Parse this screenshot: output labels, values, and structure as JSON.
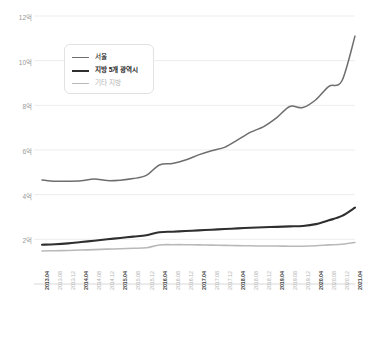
{
  "chart_data": {
    "type": "line",
    "title": "",
    "subtitle": "",
    "xlabel": "",
    "ylabel": "",
    "ylim": [
      0,
      12
    ],
    "yticks": [
      2,
      4,
      6,
      8,
      10,
      12
    ],
    "ytick_labels": [
      "2억",
      "4억",
      "6억",
      "8억",
      "10억",
      "12억"
    ],
    "grid": true,
    "legend_position": "upper-left-inside",
    "unit_note": "억",
    "x": [
      "2013.04",
      "2013.08",
      "2013.12",
      "2014.04",
      "2014.08",
      "2014.12",
      "2015.04",
      "2015.08",
      "2015.12",
      "2016.04",
      "2016.08",
      "2016.12",
      "2017.04",
      "2017.08",
      "2017.12",
      "2018.04",
      "2018.08",
      "2018.12",
      "2019.04",
      "2019.08",
      "2019.12",
      "2020.04",
      "2020.08",
      "2020.12",
      "2021.04"
    ],
    "xtick_major": [
      "2013.04",
      "2014.04",
      "2015.04",
      "2016.04",
      "2017.04",
      "2018.04",
      "2019.04",
      "2020.04",
      "2021.04"
    ],
    "series": [
      {
        "name": "서울",
        "color": "#6e6e6e",
        "width": 1.5,
        "values": [
          4.66,
          4.6,
          4.6,
          4.62,
          4.7,
          4.63,
          4.65,
          4.72,
          4.86,
          5.33,
          5.4,
          5.55,
          5.78,
          5.97,
          6.12,
          6.45,
          6.8,
          7.05,
          7.45,
          7.95,
          7.9,
          8.25,
          8.85,
          9.1,
          11.1
        ]
      },
      {
        "name": "지방 5개 광역시",
        "color": "#2f2f2f",
        "width": 2.1,
        "values": [
          1.76,
          1.78,
          1.82,
          1.88,
          1.94,
          2.0,
          2.06,
          2.12,
          2.18,
          2.32,
          2.34,
          2.37,
          2.4,
          2.43,
          2.46,
          2.49,
          2.52,
          2.54,
          2.56,
          2.58,
          2.6,
          2.68,
          2.85,
          3.05,
          3.42
        ]
      },
      {
        "name": "기타 지방",
        "color": "#b9b9b9",
        "width": 1.6,
        "values": [
          1.48,
          1.49,
          1.5,
          1.52,
          1.54,
          1.56,
          1.58,
          1.6,
          1.62,
          1.75,
          1.76,
          1.76,
          1.75,
          1.74,
          1.73,
          1.72,
          1.71,
          1.7,
          1.7,
          1.69,
          1.69,
          1.71,
          1.75,
          1.78,
          1.86
        ]
      }
    ]
  },
  "legend": {
    "items": [
      {
        "label": "서울"
      },
      {
        "label": "지방 5개 광역시"
      },
      {
        "label": "기타 지방"
      }
    ]
  },
  "colors": {
    "grid": "#ededed",
    "axis": "#d8d8d8",
    "ytick_text": "#9a9a9a",
    "xtick_text": "#b4b4b4",
    "xtick_text_major": "#4a4a4a",
    "background": "#ffffff"
  }
}
